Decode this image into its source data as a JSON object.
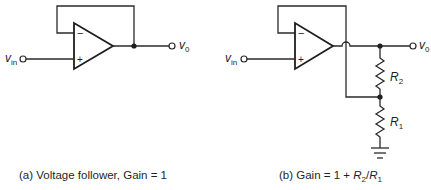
{
  "diagram": {
    "type": "op-amp circuits",
    "circuits": [
      {
        "id": "a",
        "caption": "(a) Voltage follower, Gain = 1",
        "input_label": "v",
        "input_sub": "in",
        "output_label": "v",
        "output_sub": "0",
        "minus_sign": "−",
        "plus_sign": "+"
      },
      {
        "id": "b",
        "caption_prefix": "(b) Gain = 1 + ",
        "caption_r2": "R",
        "caption_r2_sub": "2",
        "caption_slash": "/",
        "caption_r1": "R",
        "caption_r1_sub": "1",
        "input_label": "v",
        "input_sub": "in",
        "output_label": "v",
        "output_sub": "0",
        "minus_sign": "−",
        "plus_sign": "+",
        "resistors": [
          {
            "label": "R",
            "sub": "2"
          },
          {
            "label": "R",
            "sub": "1"
          }
        ]
      }
    ]
  }
}
